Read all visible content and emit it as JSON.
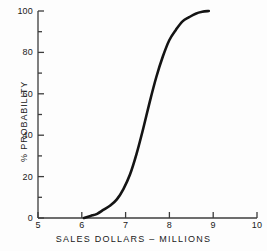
{
  "chart_data": {
    "type": "line",
    "title": "",
    "subtitle": "",
    "xlabel": "SALES DOLLARS – MILLIONS",
    "ylabel": "% PROBABILITY",
    "xlim": [
      5,
      10
    ],
    "ylim": [
      0,
      100
    ],
    "x_major_ticks": [
      5,
      6,
      7,
      8,
      9,
      10
    ],
    "x_tick_labels": [
      "5",
      "6",
      "7",
      "8",
      "9",
      "10"
    ],
    "y_major_ticks": [
      0,
      20,
      40,
      60,
      80,
      100
    ],
    "y_tick_labels": [
      "0",
      "20",
      "40",
      "60",
      "80",
      "100"
    ],
    "y_minor_ticks": [
      10,
      30,
      50,
      70,
      90
    ],
    "grid": false,
    "legend": "none",
    "line_color": "#141414",
    "line_width": 2.6,
    "axis_color": "#3c3c3c",
    "background_color": "#fdfdfd",
    "series": [
      {
        "name": "Cumulative probability",
        "x": [
          6.05,
          6.2,
          6.35,
          6.5,
          6.65,
          6.8,
          6.95,
          7.1,
          7.25,
          7.4,
          7.55,
          7.7,
          7.85,
          8.0,
          8.15,
          8.3,
          8.45,
          8.6,
          8.75,
          8.9
        ],
        "values": [
          0,
          1,
          2,
          4,
          6,
          9,
          14,
          21,
          31,
          43,
          56,
          68,
          78,
          86,
          91,
          95,
          97,
          98.7,
          99.6,
          100
        ]
      }
    ],
    "annotations": {
      "curve_start_x": 6.05,
      "curve_end_x": 8.9,
      "midpoint_x": 7.53,
      "midpoint_y": 50
    }
  },
  "axes": {
    "x_title": "SALES DOLLARS – MILLIONS",
    "y_title": "% PROBABILITY"
  }
}
